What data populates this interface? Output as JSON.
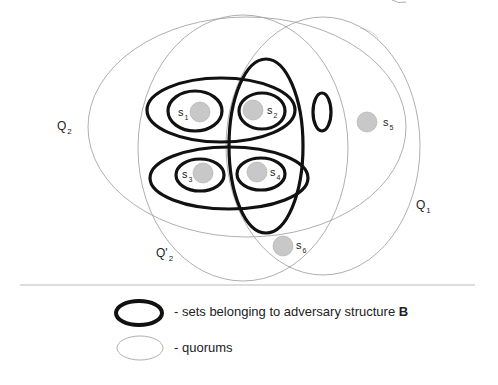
{
  "diagram": {
    "colors": {
      "background": "#ffffff",
      "quorum_stroke": "#9a9a9a",
      "adversary_stroke": "#111111",
      "server_fill": "#c8c8c8",
      "server_stroke": "#aaaaaa",
      "divider": "#bbbbbb"
    },
    "quorums": [
      {
        "id": "Q2",
        "label": "Q",
        "sub": "2",
        "cx": 247,
        "cy": 127,
        "rx": 159,
        "ry": 110,
        "label_x": 57,
        "label_y": 130
      },
      {
        "id": "Q'2",
        "label": "Q'",
        "sub": "2",
        "cx": 243,
        "cy": 148,
        "rx": 105,
        "ry": 133,
        "label_x": 156,
        "label_y": 257
      },
      {
        "id": "Q1",
        "label": "Q",
        "sub": "1",
        "cx": 323,
        "cy": 146,
        "rx": 97,
        "ry": 129,
        "label_x": 416,
        "label_y": 209
      }
    ],
    "adversary_sets": [
      {
        "id": "B-top",
        "cx": 221,
        "cy": 110,
        "rx": 74,
        "ry": 32
      },
      {
        "id": "B-s1",
        "cx": 195,
        "cy": 111,
        "rx": 27,
        "ry": 20
      },
      {
        "id": "B-s2",
        "cx": 262,
        "cy": 111,
        "rx": 23,
        "ry": 18
      },
      {
        "id": "B-vertical",
        "cx": 266,
        "cy": 146,
        "rx": 37,
        "ry": 87
      },
      {
        "id": "B-empty",
        "cx": 322,
        "cy": 112,
        "rx": 9,
        "ry": 19
      },
      {
        "id": "B-bottom",
        "cx": 229,
        "cy": 178,
        "rx": 79,
        "ry": 31
      },
      {
        "id": "B-s3",
        "cx": 200,
        "cy": 175,
        "rx": 24,
        "ry": 16
      },
      {
        "id": "B-s4",
        "cx": 261,
        "cy": 174,
        "rx": 24,
        "ry": 16
      }
    ],
    "servers": [
      {
        "id": "s1",
        "label": "s",
        "sub": "1",
        "cx": 200,
        "cy": 112,
        "r": 10,
        "label_x": 178,
        "label_y": 116
      },
      {
        "id": "s2",
        "label": "s",
        "sub": "2",
        "cx": 253,
        "cy": 110,
        "r": 10,
        "label_x": 267,
        "label_y": 114
      },
      {
        "id": "s3",
        "label": "s",
        "sub": "3",
        "cx": 203,
        "cy": 173,
        "r": 10,
        "label_x": 182,
        "label_y": 178
      },
      {
        "id": "s4",
        "label": "s",
        "sub": "4",
        "cx": 257,
        "cy": 172,
        "r": 10,
        "label_x": 270,
        "label_y": 176
      },
      {
        "id": "s5",
        "label": "s",
        "sub": "5",
        "cx": 367,
        "cy": 122,
        "r": 10,
        "label_x": 383,
        "label_y": 126
      },
      {
        "id": "s6",
        "label": "s",
        "sub": "6",
        "cx": 283,
        "cy": 246,
        "r": 10,
        "label_x": 296,
        "label_y": 249
      }
    ]
  },
  "legend": {
    "adversary_text": "- sets belonging to adversary structure ",
    "adversary_bold": "B",
    "quorum_text": "- quorums"
  }
}
